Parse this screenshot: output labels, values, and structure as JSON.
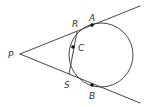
{
  "diagram": {
    "colors": {
      "stroke": "#333333",
      "point": "#111111",
      "background": "#ffffff"
    },
    "circle": {
      "cx": 101,
      "cy": 55,
      "r": 32
    },
    "lines": [
      {
        "name": "tangent-line-upper",
        "x1": 20,
        "y1": 54,
        "x2": 140,
        "y2": 6
      },
      {
        "name": "tangent-line-lower",
        "x1": 20,
        "y1": 54,
        "x2": 140,
        "y2": 103
      },
      {
        "name": "segment-RS",
        "x1": 77,
        "y1": 32,
        "x2": 69,
        "y2": 74
      }
    ],
    "points": [
      {
        "name": "A",
        "x": 92,
        "y": 25,
        "dot": true
      },
      {
        "name": "B",
        "x": 92,
        "y": 85,
        "dot": true
      },
      {
        "name": "C",
        "x": 73,
        "y": 47,
        "dot": true
      }
    ],
    "labels": {
      "P": {
        "text": "P",
        "x": 8,
        "y": 58
      },
      "R": {
        "text": "R",
        "x": 72,
        "y": 27
      },
      "A": {
        "text": "A",
        "x": 89,
        "y": 21
      },
      "C": {
        "text": "C",
        "x": 78,
        "y": 51
      },
      "S": {
        "text": "S",
        "x": 64,
        "y": 88
      },
      "B": {
        "text": "B",
        "x": 89,
        "y": 99
      }
    }
  }
}
